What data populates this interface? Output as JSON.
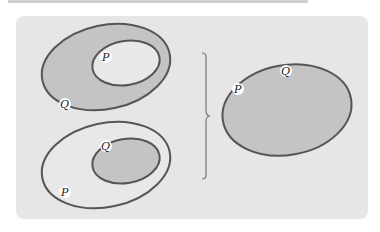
{
  "diagram": {
    "type": "set-relation-figure",
    "panel_background": "#e6e6e6",
    "stroke_color": "#555555",
    "shaded_fill": "#c4c4c4",
    "light_fill": "#e6e6e6",
    "label_bg": "#ffffff",
    "left_top": {
      "outer_label": "Q",
      "inner_label": "P",
      "description": "P inside Q (Q region shaded)"
    },
    "left_bottom": {
      "outer_label": "P",
      "inner_label": "Q",
      "description": "Q inside P (Q region shaded)"
    },
    "right": {
      "labels": [
        "P",
        "Q"
      ],
      "description": "single shaded region where P = Q"
    },
    "brace": "right-curly-brace"
  }
}
